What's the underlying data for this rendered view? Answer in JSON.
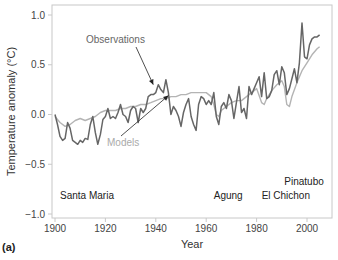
{
  "panel_label": "(a)",
  "chart_data": {
    "type": "line",
    "title": "",
    "xlabel": "Year",
    "ylabel": "Temperature anomaly (°C)",
    "xlim": [
      1900,
      2010
    ],
    "ylim": [
      -1.0,
      1.05
    ],
    "grid": false,
    "x_ticks": [
      1900,
      1920,
      1940,
      1960,
      1980,
      2000
    ],
    "y_ticks": [
      -1.0,
      -0.5,
      0.0,
      0.5,
      1.0
    ],
    "y_tick_labels": [
      "−1.0",
      "−0.5",
      "0.0",
      "0.5",
      "1.0"
    ],
    "series": [
      {
        "name": "Observations",
        "color": "#666666",
        "x": [
          1900,
          1901,
          1902,
          1903,
          1904,
          1905,
          1906,
          1907,
          1908,
          1909,
          1910,
          1911,
          1912,
          1913,
          1914,
          1915,
          1916,
          1917,
          1918,
          1919,
          1920,
          1921,
          1922,
          1923,
          1924,
          1925,
          1926,
          1927,
          1928,
          1929,
          1930,
          1931,
          1932,
          1933,
          1934,
          1935,
          1936,
          1937,
          1938,
          1939,
          1940,
          1941,
          1942,
          1943,
          1944,
          1945,
          1946,
          1947,
          1948,
          1949,
          1950,
          1951,
          1952,
          1953,
          1954,
          1955,
          1956,
          1957,
          1958,
          1959,
          1960,
          1961,
          1962,
          1963,
          1964,
          1965,
          1966,
          1967,
          1968,
          1969,
          1970,
          1971,
          1972,
          1973,
          1974,
          1975,
          1976,
          1977,
          1978,
          1979,
          1980,
          1981,
          1982,
          1983,
          1984,
          1985,
          1986,
          1987,
          1988,
          1989,
          1990,
          1991,
          1992,
          1993,
          1994,
          1995,
          1996,
          1997,
          1998,
          1999,
          2000,
          2001,
          2002,
          2003,
          2004,
          2005
        ],
        "values": [
          0.0,
          -0.1,
          -0.22,
          -0.26,
          -0.24,
          -0.08,
          -0.14,
          -0.26,
          -0.28,
          -0.3,
          -0.26,
          -0.28,
          -0.24,
          -0.25,
          -0.1,
          -0.02,
          -0.18,
          -0.3,
          -0.2,
          -0.05,
          -0.02,
          0.06,
          -0.04,
          -0.02,
          -0.04,
          0.02,
          0.1,
          0.0,
          -0.02,
          -0.08,
          0.04,
          0.08,
          0.06,
          -0.08,
          0.06,
          0.02,
          0.06,
          0.18,
          0.2,
          0.2,
          0.22,
          0.3,
          0.25,
          0.22,
          0.35,
          0.22,
          0.0,
          0.08,
          0.04,
          -0.02,
          -0.12,
          0.02,
          0.1,
          0.16,
          -0.02,
          -0.1,
          -0.16,
          0.1,
          0.18,
          0.16,
          0.1,
          0.14,
          0.1,
          0.22,
          -0.02,
          -0.1,
          0.08,
          0.12,
          0.06,
          0.2,
          0.14,
          -0.04,
          0.12,
          0.28,
          0.02,
          0.06,
          -0.04,
          0.28,
          0.2,
          0.26,
          0.32,
          0.38,
          0.18,
          0.42,
          0.16,
          0.18,
          0.24,
          0.4,
          0.44,
          0.3,
          0.48,
          0.42,
          0.2,
          0.26,
          0.36,
          0.46,
          0.32,
          0.52,
          0.92,
          0.58,
          0.56,
          0.7,
          0.76,
          0.78,
          0.78,
          0.8
        ]
      },
      {
        "name": "Models",
        "color": "#b4b4b4",
        "x": [
          1900,
          1902,
          1904,
          1906,
          1908,
          1910,
          1912,
          1914,
          1916,
          1918,
          1920,
          1922,
          1924,
          1926,
          1928,
          1930,
          1932,
          1934,
          1936,
          1938,
          1940,
          1942,
          1944,
          1946,
          1948,
          1950,
          1952,
          1954,
          1956,
          1958,
          1960,
          1962,
          1963,
          1964,
          1965,
          1966,
          1968,
          1970,
          1972,
          1974,
          1976,
          1978,
          1980,
          1982,
          1983,
          1984,
          1986,
          1988,
          1990,
          1991,
          1992,
          1993,
          1994,
          1996,
          1998,
          2000,
          2002,
          2004,
          2005
        ],
        "values": [
          -0.02,
          -0.08,
          -0.12,
          -0.1,
          -0.06,
          -0.04,
          -0.06,
          -0.04,
          -0.02,
          0.02,
          0.04,
          0.04,
          0.04,
          0.06,
          0.06,
          0.08,
          0.08,
          0.1,
          0.1,
          0.12,
          0.14,
          0.16,
          0.16,
          0.18,
          0.18,
          0.2,
          0.2,
          0.22,
          0.22,
          0.22,
          0.22,
          0.18,
          0.1,
          0.0,
          -0.02,
          0.04,
          0.08,
          0.12,
          0.14,
          0.14,
          0.18,
          0.22,
          0.26,
          0.12,
          0.1,
          0.16,
          0.24,
          0.3,
          0.34,
          0.28,
          0.1,
          0.08,
          0.18,
          0.32,
          0.44,
          0.52,
          0.6,
          0.66,
          0.68
        ]
      }
    ],
    "annotations": [
      {
        "text": "Observations",
        "x_px": 86,
        "y_px": 43,
        "color": "#666666",
        "arrow_to": [
          1939,
          0.3
        ]
      },
      {
        "text": "Models",
        "x_px": 107,
        "y_px": 146,
        "color": "#aaaaaa",
        "arrow_to": [
          1945,
          0.19
        ]
      },
      {
        "text": "Santa Maria",
        "year": 1902,
        "y_px": 199
      },
      {
        "text": "Agung",
        "year": 1963,
        "y_px": 199
      },
      {
        "text": "El Chichon",
        "year": 1982,
        "y_px": 199
      },
      {
        "text": "Pinatubo",
        "year": 1991,
        "y_px": 185
      }
    ],
    "volcanoes": [
      "Santa Maria",
      "Agung",
      "El Chichon",
      "Pinatubo"
    ]
  },
  "layout": {
    "plot": {
      "left": 52,
      "top": 5,
      "right": 332,
      "bottom": 218
    },
    "x_px_per_year": 2.52,
    "x_origin_year": 1900,
    "x_origin_px": 55,
    "y_px_per_unit": 99.5,
    "y_zero_px": 114.5
  }
}
